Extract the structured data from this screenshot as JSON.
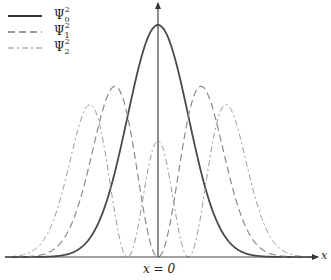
{
  "chart_data": {
    "type": "line",
    "title": "",
    "xlabel": "x",
    "ylabel": "",
    "center_label": "x = 0",
    "grid": false,
    "legend_position": "top-left",
    "x_range_xi": [
      -3.55,
      3.7
    ],
    "y_range_relative": [
      0,
      1.0
    ],
    "series": [
      {
        "name": "Ψ0²",
        "label_base": "Ψ",
        "sub": "0",
        "sup": "2",
        "style": "solid",
        "color": "#4a4a4a",
        "width": 1.8,
        "formula": "exp(-xi^2)",
        "peak_positions_xi": [
          0
        ],
        "peak_values": [
          1.0
        ]
      },
      {
        "name": "Ψ1²",
        "label_base": "Ψ",
        "sub": "1",
        "sup": "2",
        "style": "dashed",
        "color": "#8a8a8a",
        "width": 1.2,
        "formula": "2 xi^2 exp(-xi^2)",
        "peak_positions_xi": [
          -1,
          1
        ],
        "peak_values": [
          0.736,
          0.736
        ]
      },
      {
        "name": "Ψ2²",
        "label_base": "Ψ",
        "sub": "2",
        "sup": "2",
        "style": "dashdot",
        "color": "#9a9a9a",
        "width": 1.0,
        "formula": "(2 xi^2 - 1)^2 exp(-xi^2) / 2",
        "peak_positions_xi": [
          -1.58,
          0,
          1.58
        ],
        "peak_values": [
          0.657,
          0.5,
          0.657
        ],
        "zeros_xi": [
          -0.707,
          0.707
        ]
      }
    ],
    "layout": {
      "cx": 158,
      "baseline_y": 257,
      "px_per_xi": 43,
      "peak_px": 232,
      "axis_left": 5,
      "axis_right": 318,
      "axis_top": 3
    }
  }
}
